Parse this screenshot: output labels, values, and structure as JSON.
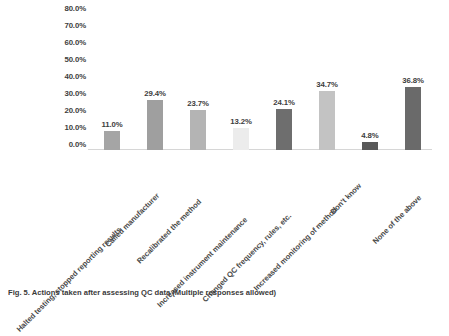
{
  "chart_data": {
    "type": "bar",
    "title": "",
    "subtitle": "",
    "xlabel": "",
    "ylabel": "",
    "ylim": [
      0,
      80
    ],
    "grid": false,
    "legend": "none",
    "ytick_labels": [
      "80.0%",
      "70.0%",
      "60.0%",
      "50.0%",
      "40.0%",
      "30.0%",
      "20.0%",
      "10.0%",
      "0.0%"
    ],
    "ytick_values": [
      80,
      70,
      60,
      50,
      40,
      30,
      20,
      10,
      0
    ],
    "categories": [
      "Halted testing, stopped reporting results",
      "Called manufacturer",
      "Recalibrated the method",
      "Increased instrument maintenance",
      "Changed QC frequency, rules, etc.",
      "Increased monitoring of method",
      "Don't know",
      "None of the above"
    ],
    "values": [
      11.0,
      29.4,
      23.7,
      13.2,
      24.1,
      34.7,
      4.8,
      36.8
    ],
    "data_labels": [
      "11.0%",
      "29.4%",
      "23.7%",
      "13.2%",
      "24.1%",
      "34.7%",
      "4.8%",
      "36.8%"
    ],
    "bar_colors": [
      "#a5a5a5",
      "#9f9f9f",
      "#b4b4b4",
      "#ececec",
      "#6e6e6e",
      "#c3c3c3",
      "#595959",
      "#6a6a6a"
    ]
  },
  "caption": {
    "text": "Fig. 5. Actions taken after assessing QC data (Multiple responses allowed)"
  }
}
